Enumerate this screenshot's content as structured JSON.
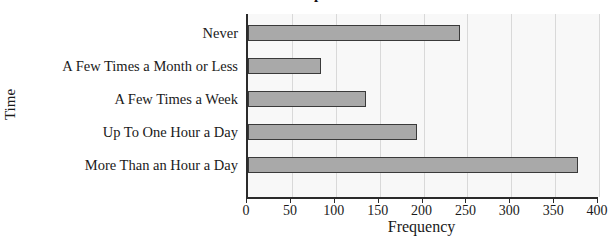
{
  "chart_data": {
    "type": "bar",
    "orientation": "horizontal",
    "title": "Time Spent",
    "xlabel": "Frequency",
    "ylabel": "Time",
    "categories": [
      "Never",
      "A Few Times a Month or Less",
      "A Few Times a Week",
      "Up To One Hour a Day",
      "More Than an Hour a Day"
    ],
    "values": [
      242,
      83,
      135,
      193,
      376
    ],
    "xlim": [
      0,
      400
    ],
    "xticks": [
      0,
      50,
      100,
      150,
      200,
      250,
      300,
      350,
      400
    ],
    "xtick_labels": [
      "0",
      "50",
      "100",
      "150",
      "200",
      "250",
      "300",
      "350",
      "400"
    ],
    "grid": "vertical",
    "legend": "none",
    "bar_color": "#a9a9a9",
    "bar_border_color": "#3a3a3a",
    "plot_background": "#f8f8f8",
    "gridline_color": "#d9d9d9",
    "axis_color": "#2b2b2b"
  }
}
